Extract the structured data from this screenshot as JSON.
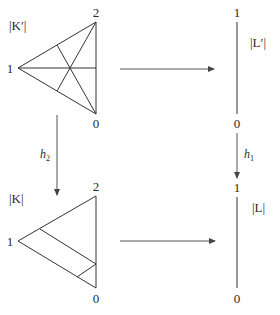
{
  "diagram": {
    "top_left": {
      "label": "|K′|",
      "vertices": {
        "v0": "0",
        "v1": "1",
        "v2": "2"
      },
      "description": "barycentric subdivision of triangle"
    },
    "top_right": {
      "label": "|L′|",
      "vertices": {
        "top": "1",
        "bottom": "0"
      }
    },
    "bottom_left": {
      "label": "|K|",
      "vertices": {
        "v0": "0",
        "v1": "1",
        "v2": "2"
      }
    },
    "bottom_right": {
      "label": "|L|",
      "vertices": {
        "top": "1",
        "bottom": "0"
      }
    },
    "maps": {
      "left_vertical": "h",
      "left_vertical_sub": "2",
      "right_vertical": "h",
      "right_vertical_sub": "1"
    },
    "colors": {
      "line": "#333333",
      "arrow": "#555555",
      "background": "#ffffff"
    }
  }
}
